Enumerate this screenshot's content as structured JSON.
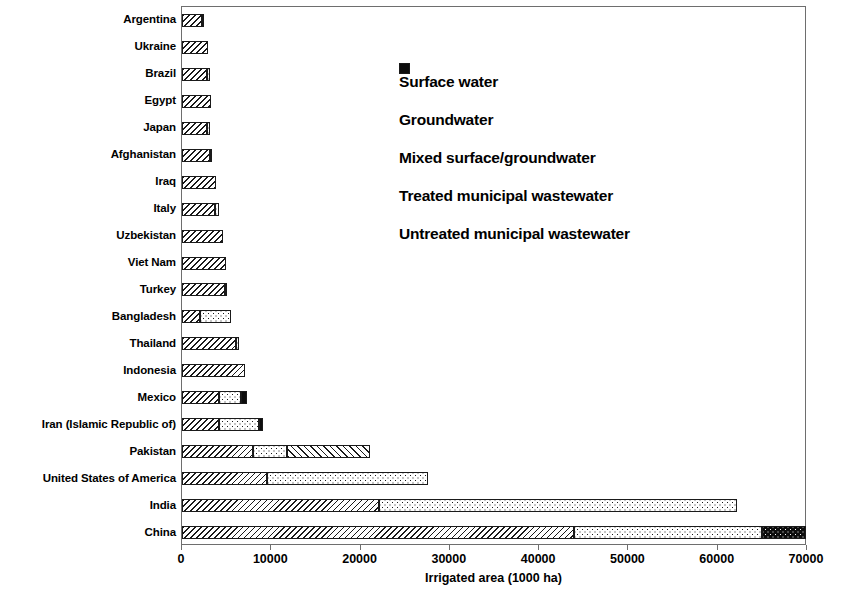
{
  "chart_data": {
    "type": "bar",
    "orientation": "horizontal",
    "stacked": true,
    "title": "",
    "xlabel": "Irrigated area (1000 ha)",
    "ylabel": "",
    "xlim": [
      0,
      70000
    ],
    "xticks": [
      0,
      10000,
      20000,
      30000,
      40000,
      50000,
      60000,
      70000
    ],
    "xticklabels": [
      "0",
      "10000",
      "20000",
      "30000",
      "40000",
      "50000",
      "60000",
      "70000"
    ],
    "grid": false,
    "legend_position": "upper center inside plot",
    "categories": [
      "Argentina",
      "Ukraine",
      "Brazil",
      "Egypt",
      "Japan",
      "Afghanistan",
      "Iraq",
      "Italy",
      "Uzbekistan",
      "Viet Nam",
      "Turkey",
      "Bangladesh",
      "Thailand",
      "Indonesia",
      "Mexico",
      "Iran (Islamic Republic of)",
      "Pakistan",
      "United States of America",
      "India",
      "China"
    ],
    "series": [
      {
        "name": "Surface water",
        "pattern": "backslash-hatch",
        "color": "#ffffff",
        "values": [
          2200,
          2900,
          2800,
          3300,
          2800,
          3100,
          3800,
          3700,
          4600,
          4950,
          4800,
          2000,
          6100,
          7050,
          4150,
          4100,
          8000,
          9500,
          22100,
          43900
        ]
      },
      {
        "name": "Groundwater",
        "pattern": "dots",
        "color": "#ffffff",
        "values": [
          300,
          0,
          350,
          0,
          350,
          300,
          0,
          450,
          0,
          0,
          250,
          3500,
          300,
          0,
          2450,
          4550,
          3800,
          18100,
          40100,
          21100
        ]
      },
      {
        "name": "Mixed surface/groundwater",
        "pattern": "forwardslash-hatch",
        "color": "#ffffff",
        "values": [
          0,
          0,
          0,
          0,
          0,
          0,
          0,
          0,
          0,
          0,
          0,
          0,
          0,
          0,
          0,
          0,
          9300,
          0,
          0,
          0
        ]
      },
      {
        "name": "Treated municipal wastewater",
        "pattern": "black-with-dots",
        "color": "#0d0d0d",
        "values": [
          0,
          0,
          0,
          0,
          0,
          0,
          0,
          0,
          0,
          0,
          0,
          0,
          0,
          0,
          0,
          0,
          0,
          0,
          0,
          4900
        ]
      },
      {
        "name": "Untreated municipal wastewater",
        "pattern": "solid-black",
        "color": "#0d0d0d",
        "values": [
          0,
          0,
          0,
          0,
          0,
          0,
          0,
          0,
          0,
          0,
          0,
          0,
          0,
          0,
          700,
          450,
          0,
          0,
          0,
          0
        ]
      }
    ]
  },
  "legend": {
    "items": [
      {
        "label": "Surface water",
        "swatch": "surface"
      },
      {
        "label": "Groundwater",
        "swatch": "ground"
      },
      {
        "label": "Mixed surface/groundwater",
        "swatch": "mixed"
      },
      {
        "label": "Treated municipal wastewater",
        "swatch": "treated"
      },
      {
        "label": "Untreated municipal wastewater",
        "swatch": "untreated"
      }
    ]
  }
}
